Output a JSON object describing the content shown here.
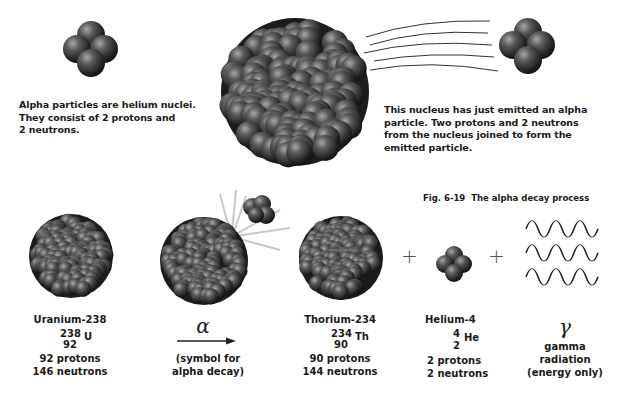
{
  "top": {
    "alpha_caption": [
      "Alpha particles are helium nuclei.",
      "They consist of 2 protons and",
      "2 neutrons."
    ],
    "nucleus_caption": [
      "This nucleus has just emitted an alpha",
      "particle. Two protons and 2 neutrons",
      "from the nucleus joined to form the",
      "emitted particle."
    ]
  },
  "figure": {
    "number": "Fig. 6-19",
    "title": "The alpha decay process"
  },
  "equation": {
    "uranium": {
      "name": "Uranium-238",
      "mass": "238",
      "atomic": "92",
      "symbol": "U",
      "protons": "92 protons",
      "neutrons": "146 neutrons"
    },
    "arrow": {
      "symbol": "α",
      "note": [
        "(symbol for",
        "alpha decay)"
      ]
    },
    "thorium": {
      "name": "Thorium-234",
      "mass": "234",
      "atomic": "90",
      "symbol": "Th",
      "protons": "90 protons",
      "neutrons": "144 neutrons"
    },
    "plus1": "+",
    "helium": {
      "name": "Helium-4",
      "mass": "4",
      "atomic": "2",
      "symbol": "He",
      "protons": "2 protons",
      "neutrons": "2 neutrons"
    },
    "plus2": "+",
    "gamma": {
      "symbol": "γ",
      "note": [
        "gamma",
        "radiation",
        "(energy only)"
      ]
    }
  },
  "colors": {
    "sphere_light": "#9a9a9a",
    "sphere_dark": "#1e1e1e",
    "text": "#1a1a1a"
  }
}
